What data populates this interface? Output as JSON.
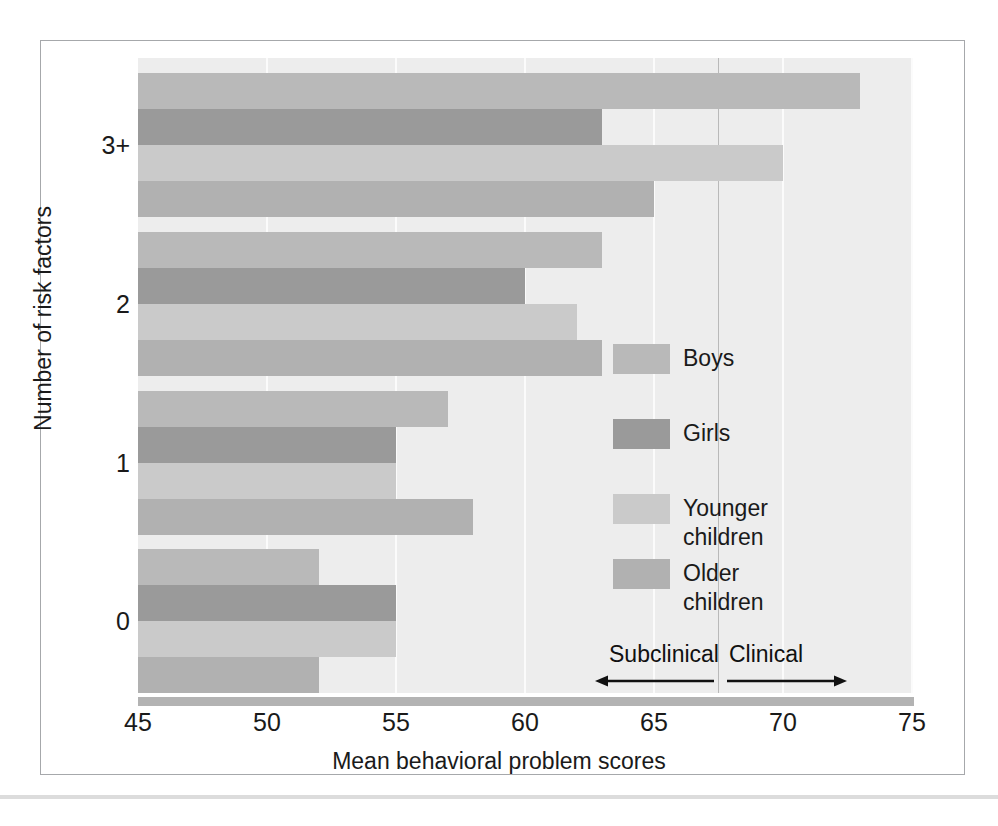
{
  "chart_data": {
    "type": "bar",
    "orientation": "horizontal",
    "title": "",
    "xlabel": "Mean behavioral problem scores",
    "ylabel": "Number of risk factors",
    "categories": [
      "0",
      "1",
      "2",
      "3+"
    ],
    "xlim": [
      45,
      75
    ],
    "xticks": [
      45,
      50,
      55,
      60,
      65,
      70,
      75
    ],
    "grid": true,
    "legend_position": "inside-right",
    "series": [
      {
        "name": "Boys",
        "color": "#b9b9b9",
        "values": [
          52,
          57,
          63,
          73
        ]
      },
      {
        "name": "Girls",
        "color": "#9a9a9a",
        "values": [
          55,
          55,
          60,
          63
        ]
      },
      {
        "name": "Younger children",
        "color": "#cacaca",
        "values": [
          55,
          55,
          62,
          70
        ]
      },
      {
        "name": "Older children",
        "color": "#b1b1b1",
        "values": [
          52,
          58,
          63,
          65
        ]
      }
    ],
    "annotations": [
      {
        "name": "subclinical",
        "label": "Subclinical",
        "direction": "left",
        "threshold": 67.5
      },
      {
        "name": "clinical",
        "label": "Clinical",
        "direction": "right",
        "threshold": 67.5
      }
    ],
    "threshold_line": 67.5,
    "plot_background": "#ededed",
    "gridline_color": "#fbfbfb"
  },
  "legend": {
    "items": [
      {
        "label": "Boys"
      },
      {
        "label": "Girls"
      },
      {
        "label": "Younger\nchildren"
      },
      {
        "label": "Older\nchildren"
      }
    ]
  },
  "axes": {
    "x_title": "Mean behavioral problem scores",
    "y_title": "Number of risk factors",
    "x_tick_labels": [
      "45",
      "50",
      "55",
      "60",
      "65",
      "70",
      "75"
    ],
    "y_tick_labels": [
      "0",
      "1",
      "2",
      "3+"
    ]
  },
  "annotations": {
    "subclinical_label": "Subclinical",
    "clinical_label": "Clinical"
  }
}
